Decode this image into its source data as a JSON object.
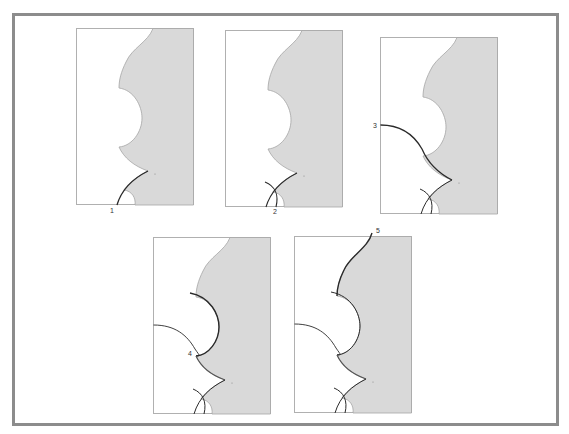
{
  "figure": {
    "colors": {
      "frame": "#8c8c8c",
      "fill": "#d9d9d9",
      "outline": "#a6a6a6",
      "trace": "#2a2a2a",
      "panel_border": "#b0b0b0",
      "background": "#ffffff"
    },
    "panels": [
      {
        "id": 1,
        "label": "1",
        "highlight": "lower flank trace from bottom to tooth tip"
      },
      {
        "id": 2,
        "label": "2",
        "highlight": "lower flank trace with crossing arc at root"
      },
      {
        "id": 3,
        "label": "3",
        "highlight": "curve from left edge sweeping to tooth tip"
      },
      {
        "id": 4,
        "label": "4",
        "highlight": "semicircular notch traced, point marked 4"
      },
      {
        "id": 5,
        "label": "5",
        "highlight": "upper flank traced from top edge to notch"
      }
    ]
  }
}
